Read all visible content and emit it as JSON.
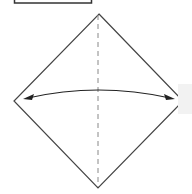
{
  "diagram": {
    "type": "origami-fold-step",
    "colors": {
      "line": "#333333",
      "fold_line": "#777777",
      "side_box": "#f2f2f2",
      "background": "#ffffff"
    },
    "elements": [
      {
        "name": "step-label-box",
        "shape": "rectangle",
        "x": 14,
        "y": -4,
        "w": 77,
        "h": 7
      },
      {
        "name": "paper-square",
        "shape": "diamond",
        "top": [
          99,
          14
        ],
        "right": [
          183,
          101
        ],
        "bottom": [
          98,
          188
        ],
        "left": [
          14,
          101
        ]
      },
      {
        "name": "valley-fold-line",
        "shape": "dashed-line",
        "from": [
          98,
          14
        ],
        "to": [
          98,
          188
        ]
      },
      {
        "name": "fold-arrow",
        "shape": "double-arrow-arc",
        "from": [
          24,
          99
        ],
        "to": [
          174,
          99
        ],
        "curve_peak_y": 90
      }
    ]
  }
}
